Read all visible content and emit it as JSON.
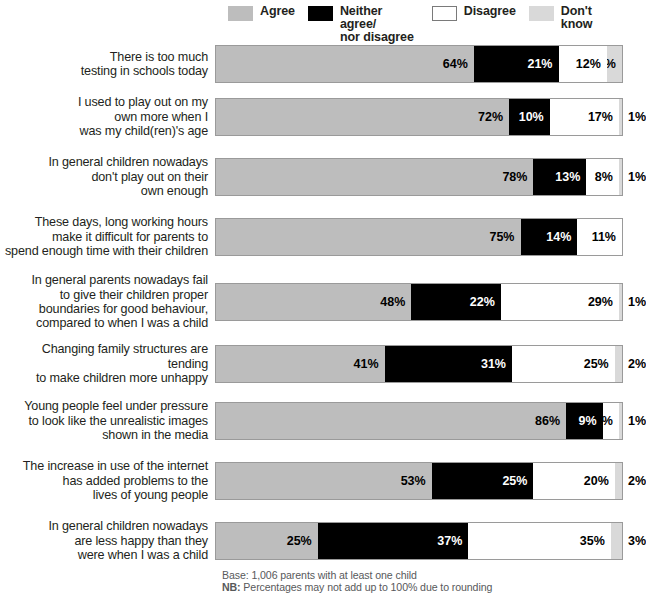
{
  "legend": {
    "items": [
      {
        "label": "Agree",
        "swatch": "agree-swatch",
        "color": "#BDBDBD"
      },
      {
        "label": "Neither agree/\nnor disagree",
        "swatch": "neither-swatch",
        "color": "#000000"
      },
      {
        "label": "Disagree",
        "swatch": "disagree-swatch",
        "color": "#FFFFFF"
      },
      {
        "label": "Don't know",
        "swatch": "dont-know-swatch",
        "color": "#D9D9D9"
      }
    ]
  },
  "footer": {
    "base": "Base: 1,006 parents with at least one child",
    "note_prefix": "NB:",
    "note": " Percentages may not add up to 100% due to rounding"
  },
  "chart_data": {
    "type": "bar",
    "orientation": "horizontal",
    "stacked": true,
    "stack_total": 100,
    "units": "%",
    "title": "",
    "xlabel": "",
    "ylabel": "",
    "xlim": [
      0,
      100
    ],
    "grid": false,
    "legend_position": "top",
    "series": [
      {
        "name": "Agree",
        "color": "#BDBDBD",
        "values": [
          64,
          72,
          78,
          75,
          48,
          41,
          86,
          53,
          25
        ]
      },
      {
        "name": "Neither agree/nor disagree",
        "color": "#000000",
        "values": [
          21,
          10,
          13,
          14,
          22,
          31,
          9,
          25,
          37
        ]
      },
      {
        "name": "Disagree",
        "color": "#FFFFFF",
        "values": [
          12,
          17,
          8,
          11,
          29,
          25,
          4,
          20,
          35
        ]
      },
      {
        "name": "Don't know",
        "color": "#D9D9D9",
        "values": [
          4,
          1,
          1,
          0,
          1,
          2,
          1,
          2,
          3
        ]
      }
    ],
    "categories": [
      "There is too much\ntesting in schools today",
      "I used to play out on my\nown more when I\nwas my child(ren)'s age",
      "In general children nowadays\ndon't play out on their\nown enough",
      "These days, long working hours\nmake it difficult for parents to\nspend enough time with their children",
      "In general parents nowadays fail\nto give their children proper\nboundaries for good behaviour,\ncompared to when I was a child",
      "Changing family structures are tending\nto make children more unhappy",
      "Young people feel under pressure\nto look like the unrealistic images\nshown in the media",
      "The increase in use of the internet\nhas added problems to the\nlives of young people",
      "In general children nowadays\nare less happy than they\nwere when I was a child"
    ]
  },
  "rows": [
    {
      "label": "There is too much\ntesting in schools today",
      "height": 46,
      "segments": [
        {
          "series": "Agree",
          "value": 64,
          "text": "64%",
          "inside": true
        },
        {
          "series": "Neither",
          "value": 21,
          "text": "21%",
          "inside": true
        },
        {
          "series": "Disagree",
          "value": 12,
          "text": "12%",
          "inside": true
        },
        {
          "series": "DontKnow",
          "value": 4,
          "text": "4%",
          "inside": true
        }
      ],
      "outside_label": ""
    },
    {
      "label": "I used to play out on my\nown more when I\nwas my child(ren)'s age",
      "height": 60,
      "segments": [
        {
          "series": "Agree",
          "value": 72,
          "text": "72%",
          "inside": true
        },
        {
          "series": "Neither",
          "value": 10,
          "text": "10%",
          "inside": true
        },
        {
          "series": "Disagree",
          "value": 17,
          "text": "17%",
          "inside": true
        },
        {
          "series": "DontKnow",
          "value": 1,
          "text": "1%",
          "inside": false
        }
      ],
      "outside_label": "1%"
    },
    {
      "label": "In general children nowadays\ndon't play out on their\nown enough",
      "height": 60,
      "segments": [
        {
          "series": "Agree",
          "value": 78,
          "text": "78%",
          "inside": true
        },
        {
          "series": "Neither",
          "value": 13,
          "text": "13%",
          "inside": true
        },
        {
          "series": "Disagree",
          "value": 8,
          "text": "8%",
          "inside": true
        },
        {
          "series": "DontKnow",
          "value": 1,
          "text": "1%",
          "inside": false
        }
      ],
      "outside_label": "1%"
    },
    {
      "label": "These days, long working hours\nmake it difficult for parents to\nspend enough time with their children",
      "height": 60,
      "segments": [
        {
          "series": "Agree",
          "value": 75,
          "text": "75%",
          "inside": true
        },
        {
          "series": "Neither",
          "value": 14,
          "text": "14%",
          "inside": true
        },
        {
          "series": "Disagree",
          "value": 11,
          "text": "11%",
          "inside": true
        }
      ],
      "outside_label": ""
    },
    {
      "label": "In general parents nowadays fail\nto give their children proper\nboundaries for good behaviour,\ncompared to when I was a child",
      "height": 70,
      "segments": [
        {
          "series": "Agree",
          "value": 48,
          "text": "48%",
          "inside": true
        },
        {
          "series": "Neither",
          "value": 22,
          "text": "22%",
          "inside": true
        },
        {
          "series": "Disagree",
          "value": 29,
          "text": "29%",
          "inside": true
        },
        {
          "series": "DontKnow",
          "value": 1,
          "text": "1%",
          "inside": false
        }
      ],
      "outside_label": "1%"
    },
    {
      "label": "Changing family structures are tending\nto make children more unhappy",
      "height": 54,
      "segments": [
        {
          "series": "Agree",
          "value": 41,
          "text": "41%",
          "inside": true
        },
        {
          "series": "Neither",
          "value": 31,
          "text": "31%",
          "inside": true
        },
        {
          "series": "Disagree",
          "value": 25,
          "text": "25%",
          "inside": true
        },
        {
          "series": "DontKnow",
          "value": 2,
          "text": "2%",
          "inside": false
        }
      ],
      "outside_label": "2%"
    },
    {
      "label": "Young people feel under pressure\nto look like the unrealistic images\nshown in the media",
      "height": 60,
      "segments": [
        {
          "series": "Agree",
          "value": 86,
          "text": "86%",
          "inside": true
        },
        {
          "series": "Neither",
          "value": 9,
          "text": "9%",
          "inside": true
        },
        {
          "series": "Disagree",
          "value": 4,
          "text": "4%",
          "inside": true
        },
        {
          "series": "DontKnow",
          "value": 1,
          "text": "1%",
          "inside": false
        }
      ],
      "outside_label": "1%"
    },
    {
      "label": "The increase in use of the internet\nhas added problems to the\nlives of young people",
      "height": 60,
      "segments": [
        {
          "series": "Agree",
          "value": 53,
          "text": "53%",
          "inside": true
        },
        {
          "series": "Neither",
          "value": 25,
          "text": "25%",
          "inside": true
        },
        {
          "series": "Disagree",
          "value": 20,
          "text": "20%",
          "inside": true
        },
        {
          "series": "DontKnow",
          "value": 2,
          "text": "2%",
          "inside": false
        }
      ],
      "outside_label": "2%"
    },
    {
      "label": "In general children nowadays\nare less happy than they\nwere when I was a child",
      "height": 60,
      "segments": [
        {
          "series": "Agree",
          "value": 25,
          "text": "25%",
          "inside": true
        },
        {
          "series": "Neither",
          "value": 37,
          "text": "37%",
          "inside": true
        },
        {
          "series": "Disagree",
          "value": 35,
          "text": "35%",
          "inside": true
        },
        {
          "series": "DontKnow",
          "value": 3,
          "text": "3%",
          "inside": false
        }
      ],
      "outside_label": "3%"
    }
  ]
}
